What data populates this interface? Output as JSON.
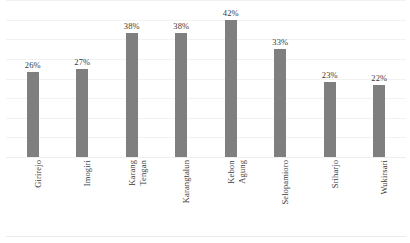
{
  "chart_data": {
    "type": "bar",
    "title": "",
    "subtitle": "",
    "xlabel": "",
    "ylabel": "",
    "ylim": [
      0,
      48
    ],
    "grid": true,
    "legend": false,
    "orientation": "vertical",
    "bar_color": "#7f7f7f",
    "label_suffix": "%",
    "categories": [
      "Girirejo",
      "Imogiri",
      "Karang Tengan",
      "Karangtalun",
      "Kebon Agung",
      "Selopamioro",
      "Sriharjo",
      "Wukirsari"
    ],
    "category_lines": [
      [
        "Girirejo"
      ],
      [
        "Imogiri"
      ],
      [
        "Karang",
        "Tengan"
      ],
      [
        "Karangtalun"
      ],
      [
        "Kebon",
        "Agung"
      ],
      [
        "Selopamioro"
      ],
      [
        "Sriharjo"
      ],
      [
        "Wukirsari"
      ]
    ],
    "values": [
      26,
      27,
      38,
      38,
      42,
      33,
      23,
      22
    ],
    "data_labels": [
      "26%",
      "27%",
      "38%",
      "38%",
      "42%",
      "33%",
      "23%",
      "22%"
    ],
    "gridline_values": [
      6,
      12,
      18,
      24,
      30,
      36,
      42,
      48
    ],
    "axis": {
      "show_y_ticks": false,
      "show_x_ticks": false,
      "baseline_value": 0
    }
  }
}
